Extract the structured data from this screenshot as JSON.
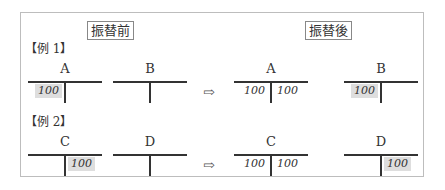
{
  "headers": {
    "before": "振替前",
    "after": "振替後"
  },
  "examples": [
    {
      "label": "【例 1】",
      "before": [
        {
          "name": "A",
          "debit": "100",
          "credit": "",
          "debit_highlight": true,
          "credit_highlight": false
        },
        {
          "name": "B",
          "debit": "",
          "credit": "",
          "debit_highlight": false,
          "credit_highlight": false
        }
      ],
      "after": [
        {
          "name": "A",
          "debit": "100",
          "credit": "100",
          "debit_highlight": false,
          "credit_highlight": false
        },
        {
          "name": "B",
          "debit": "100",
          "credit": "",
          "debit_highlight": true,
          "credit_highlight": false
        }
      ]
    },
    {
      "label": "【例 2】",
      "before": [
        {
          "name": "C",
          "debit": "",
          "credit": "100",
          "debit_highlight": false,
          "credit_highlight": true
        },
        {
          "name": "D",
          "debit": "",
          "credit": "",
          "debit_highlight": false,
          "credit_highlight": false
        }
      ],
      "after": [
        {
          "name": "C",
          "debit": "100",
          "credit": "100",
          "debit_highlight": false,
          "credit_highlight": false
        },
        {
          "name": "D",
          "debit": "",
          "credit": "100",
          "debit_highlight": false,
          "credit_highlight": true
        }
      ]
    }
  ],
  "arrow": "⇨"
}
